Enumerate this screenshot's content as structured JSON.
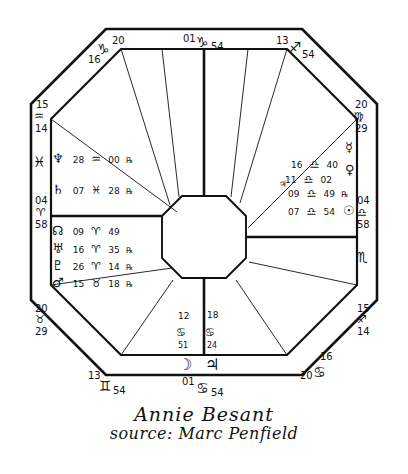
{
  "chart": {
    "title": "Annie Besant",
    "source": "source: Marc Penfield",
    "type": "natal-horoscope-square-wheel",
    "house_cusps": [
      {
        "id": "asc",
        "deg": "15",
        "sign": "♒",
        "min": "14",
        "position": "left-upper",
        "label": "Ascendant 15 Aquarius 14"
      },
      {
        "id": "h2",
        "deg": "04",
        "sign": "♈",
        "min": "58",
        "position": "left-middle",
        "label": "2nd house 04 Aries 58"
      },
      {
        "id": "h3",
        "deg": "20",
        "sign": "♉",
        "min": "29",
        "position": "left-lower",
        "label": "3rd house 20 Taurus 29"
      },
      {
        "id": "ic",
        "deg": "13",
        "sign": "♊",
        "min": "54",
        "position": "bottom-left",
        "label": "4th house 13 Gemini 54"
      },
      {
        "id": "h5",
        "deg": "01",
        "sign": "♋",
        "min": "54",
        "position": "bottom-center",
        "label": "5th house 01 Cancer 54"
      },
      {
        "id": "h6",
        "deg": "16",
        "sign": "♋",
        "min": "20",
        "position": "bottom-right",
        "label": "6th house 16 Cancer 20"
      },
      {
        "id": "dsc",
        "deg": "15",
        "sign": "♐",
        "min": "14",
        "position": "right-lower",
        "label": "Descendant 15 Leo 14"
      },
      {
        "id": "h8",
        "deg": "04",
        "sign": "♎",
        "min": "58",
        "position": "right-middle",
        "label": "8th house 04 Libra 58"
      },
      {
        "id": "h9",
        "deg": "20",
        "sign": "♍",
        "min": "29",
        "position": "right-upper",
        "label": "9th house 20 Virgo 29"
      },
      {
        "id": "mc",
        "deg": "13",
        "sign": "♐",
        "min": "54",
        "position": "top-right",
        "label": "10th house 13 Sagittarius 54"
      },
      {
        "id": "h11",
        "deg": "01",
        "sign": "♑",
        "min": "54",
        "position": "top-center",
        "label": "11th house 01 Capricorn 54"
      },
      {
        "id": "h12",
        "deg": "16",
        "sign": "♑",
        "min": "20",
        "position": "top-left",
        "label": "12th house 16 Capricorn 20"
      }
    ],
    "intercepted_signs": [
      {
        "glyph": "♓",
        "position": "left-edge",
        "label": "Pisces"
      },
      {
        "glyph": "♏",
        "position": "right-edge",
        "label": "Scorpio"
      }
    ],
    "planets": [
      {
        "glyph": "♆",
        "name": "Neptune",
        "deg": "28",
        "sign": "♒",
        "min": "00",
        "retro": "℞",
        "house": "12"
      },
      {
        "glyph": "♄",
        "name": "Saturn",
        "deg": "07",
        "sign": "♓",
        "min": "28",
        "retro": "℞",
        "house": "1"
      },
      {
        "glyph": "☊",
        "name": "North Node",
        "deg": "09",
        "sign": "♈",
        "min": "49",
        "retro": "",
        "house": "2"
      },
      {
        "glyph": "♅",
        "name": "Uranus",
        "deg": "16",
        "sign": "♈",
        "min": "35",
        "retro": "℞",
        "house": "2"
      },
      {
        "glyph": "♇",
        "name": "Pluto",
        "deg": "26",
        "sign": "♈",
        "min": "14",
        "retro": "℞",
        "house": "2"
      },
      {
        "glyph": "♂",
        "name": "Mars",
        "deg": "15",
        "sign": "♉",
        "min": "18",
        "retro": "℞",
        "house": "3"
      },
      {
        "glyph": "☿",
        "name": "Mercury",
        "deg": "16",
        "sign": "♎",
        "min": "40",
        "retro": "",
        "house": "8"
      },
      {
        "glyph": "♀",
        "name": "Venus",
        "deg": "11",
        "sign": "♎",
        "min": "02",
        "retro": "",
        "house": "8"
      },
      {
        "glyph": "♃",
        "name": "Jupiter",
        "deg": "09",
        "sign": "♎",
        "min": "49",
        "retro": "℞",
        "house": "8"
      },
      {
        "glyph": "☉",
        "name": "Sun",
        "deg": "07",
        "sign": "♎",
        "min": "54",
        "retro": "",
        "house": "8"
      },
      {
        "glyph": "☽",
        "name": "Moon",
        "deg": "12",
        "sign": "♋",
        "min": "51",
        "retro": "",
        "house": "5"
      },
      {
        "glyph": "♃",
        "name": "Jupiter-lower",
        "deg": "18",
        "sign": "♋",
        "min": "24",
        "retro": "",
        "house": "5"
      }
    ],
    "colors": {
      "ink": "#111111",
      "paper": "#ffffff"
    }
  }
}
